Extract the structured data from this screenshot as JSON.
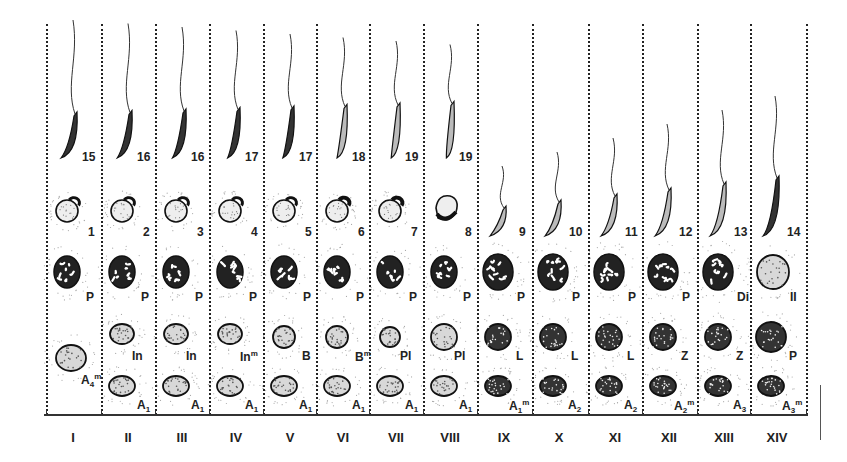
{
  "figure": {
    "type": "seminiferous epithelium cycle plate",
    "stages": [
      {
        "roman": "I",
        "spermatid_top": "15",
        "spermatid_mid": "1",
        "row_P": "P",
        "row_mid": "",
        "row_bottom": "A4m"
      },
      {
        "roman": "II",
        "spermatid_top": "16",
        "spermatid_mid": "2",
        "row_P": "P",
        "row_mid": "In",
        "row_bottom": "A1"
      },
      {
        "roman": "III",
        "spermatid_top": "16",
        "spermatid_mid": "3",
        "row_P": "P",
        "row_mid": "In",
        "row_bottom": "A1"
      },
      {
        "roman": "IV",
        "spermatid_top": "17",
        "spermatid_mid": "4",
        "row_P": "P",
        "row_mid": "Inm",
        "row_bottom": "A1"
      },
      {
        "roman": "V",
        "spermatid_top": "17",
        "spermatid_mid": "5",
        "row_P": "P",
        "row_mid": "B",
        "row_bottom": "A1"
      },
      {
        "roman": "VI",
        "spermatid_top": "18",
        "spermatid_mid": "6",
        "row_P": "P",
        "row_mid": "Bm",
        "row_bottom": "A1"
      },
      {
        "roman": "VII",
        "spermatid_top": "19",
        "spermatid_mid": "7",
        "row_P": "P",
        "row_mid": "Pl",
        "row_bottom": "A1"
      },
      {
        "roman": "VIII",
        "spermatid_top": "19",
        "spermatid_mid": "8",
        "row_P": "P",
        "row_mid": "Pl",
        "row_bottom": "A1"
      },
      {
        "roman": "IX",
        "spermatid_top": "",
        "spermatid_mid": "9",
        "row_P": "P",
        "row_mid": "L",
        "row_bottom": "A1m"
      },
      {
        "roman": "X",
        "spermatid_top": "",
        "spermatid_mid": "10",
        "row_P": "P",
        "row_mid": "L",
        "row_bottom": "A2"
      },
      {
        "roman": "XI",
        "spermatid_top": "",
        "spermatid_mid": "11",
        "row_P": "P",
        "row_mid": "L",
        "row_bottom": "A2"
      },
      {
        "roman": "XII",
        "spermatid_top": "",
        "spermatid_mid": "12",
        "row_P": "P",
        "row_mid": "Z",
        "row_bottom": "A2m"
      },
      {
        "roman": "XIII",
        "spermatid_top": "",
        "spermatid_mid": "13",
        "row_P": "Di",
        "row_mid": "Z",
        "row_bottom": "A3"
      },
      {
        "roman": "XIV",
        "spermatid_top": "",
        "spermatid_mid": "14",
        "row_P": "II",
        "row_mid": "P",
        "row_bottom": "A3m"
      }
    ],
    "labels": {
      "I": {
        "top": "15",
        "mid": "1",
        "p": "P",
        "b_main": "A",
        "b_sub": "4",
        "b_sup": "m"
      },
      "II": {
        "top": "16",
        "mid": "2",
        "p": "P",
        "m": "In",
        "b_main": "A",
        "b_sub": "1",
        "b_sup": ""
      },
      "III": {
        "top": "16",
        "mid": "3",
        "p": "P",
        "m": "In",
        "b_main": "A",
        "b_sub": "1",
        "b_sup": ""
      },
      "IV": {
        "top": "17",
        "mid": "4",
        "p": "P",
        "m": "In",
        "m_sup": "m",
        "b_main": "A",
        "b_sub": "1",
        "b_sup": ""
      },
      "V": {
        "top": "17",
        "mid": "5",
        "p": "P",
        "m": "B",
        "b_main": "A",
        "b_sub": "1",
        "b_sup": ""
      },
      "VI": {
        "top": "18",
        "mid": "6",
        "p": "P",
        "m": "B",
        "m_sup": "m",
        "b_main": "A",
        "b_sub": "1",
        "b_sup": ""
      },
      "VII": {
        "top": "19",
        "mid": "7",
        "p": "P",
        "m": "Pl",
        "b_main": "A",
        "b_sub": "1",
        "b_sup": ""
      },
      "VIII": {
        "top": "19",
        "mid": "8",
        "p": "P",
        "m": "Pl",
        "b_main": "A",
        "b_sub": "1",
        "b_sup": ""
      },
      "IX": {
        "mid": "9",
        "p": "P",
        "m": "L",
        "b_main": "A",
        "b_sub": "1",
        "b_sup": "m"
      },
      "X": {
        "mid": "10",
        "p": "P",
        "m": "L",
        "b_main": "A",
        "b_sub": "2",
        "b_sup": ""
      },
      "XI": {
        "mid": "11",
        "p": "P",
        "m": "L",
        "b_main": "A",
        "b_sub": "2",
        "b_sup": ""
      },
      "XII": {
        "mid": "12",
        "p": "P",
        "m": "Z",
        "b_main": "A",
        "b_sub": "2",
        "b_sup": "m"
      },
      "XIII": {
        "mid": "13",
        "p": "Di",
        "m": "Z",
        "b_main": "A",
        "b_sub": "3",
        "b_sup": ""
      },
      "XIV": {
        "mid": "14",
        "p": "II",
        "m": "P",
        "b_main": "A",
        "b_sub": "3",
        "b_sup": "m"
      }
    },
    "colors": {
      "ink": "#1a1a1a",
      "stipple": "#9a9a9a",
      "paper": "#ffffff"
    }
  }
}
